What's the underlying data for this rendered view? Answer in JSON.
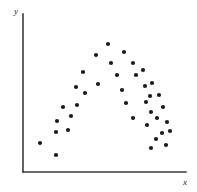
{
  "figure": {
    "width": 197,
    "height": 192,
    "background_color": "#ffffff",
    "point_color": "#1a1a1a",
    "axis_color": "#3a3a3a",
    "title": ""
  },
  "axes": {
    "y_label": "y",
    "x_label": "x",
    "y_axis_x": 23,
    "y_axis_top": 14,
    "y_axis_bottom": 172,
    "x_axis_left": 23,
    "x_axis_right": 186,
    "x_axis_y": 172,
    "y_label_pos": [
      14,
      14
    ],
    "x_label_pos": [
      183,
      185
    ]
  },
  "chart_data": {
    "type": "scatter",
    "title": "",
    "xlabel": "x",
    "ylabel": "y",
    "grid": false,
    "legend": null,
    "xlim": [
      0,
      100
    ],
    "ylim": [
      0,
      100
    ],
    "marker": "filled-circle",
    "marker_size_px": 3,
    "n_points": 38,
    "points_px": [
      [
        40,
        143
      ],
      [
        56,
        155
      ],
      [
        56,
        132
      ],
      [
        68,
        130
      ],
      [
        57,
        121
      ],
      [
        71,
        116
      ],
      [
        63,
        107
      ],
      [
        77,
        105
      ],
      [
        76,
        87
      ],
      [
        85,
        93
      ],
      [
        83,
        72
      ],
      [
        98,
        84
      ],
      [
        96,
        55
      ],
      [
        111,
        63
      ],
      [
        108,
        44
      ],
      [
        117,
        75
      ],
      [
        124,
        52
      ],
      [
        133,
        63
      ],
      [
        136,
        75
      ],
      [
        143,
        70
      ],
      [
        145,
        86
      ],
      [
        152,
        83
      ],
      [
        150,
        96
      ],
      [
        159,
        95
      ],
      [
        146,
        102
      ],
      [
        151,
        112
      ],
      [
        157,
        118
      ],
      [
        163,
        107
      ],
      [
        167,
        122
      ],
      [
        147,
        125
      ],
      [
        162,
        133
      ],
      [
        170,
        131
      ],
      [
        156,
        139
      ],
      [
        166,
        145
      ],
      [
        151,
        148
      ],
      [
        133,
        118
      ],
      [
        126,
        103
      ],
      [
        122,
        90
      ]
    ],
    "x": [
      12,
      21,
      21,
      28,
      22,
      30,
      25,
      33,
      33,
      38,
      37,
      46,
      45,
      54,
      52,
      58,
      62,
      68,
      70,
      74,
      75,
      79,
      78,
      84,
      76,
      79,
      82,
      86,
      89,
      76,
      86,
      90,
      82,
      88,
      79,
      68,
      63,
      61
    ],
    "y": [
      18,
      11,
      25,
      27,
      33,
      36,
      42,
      43,
      54,
      50,
      63,
      56,
      74,
      69,
      80,
      61,
      72,
      69,
      63,
      66,
      57,
      58,
      51,
      52,
      47,
      41,
      38,
      44,
      35,
      36,
      30,
      31,
      27,
      23,
      21,
      34,
      43,
      51
    ]
  }
}
